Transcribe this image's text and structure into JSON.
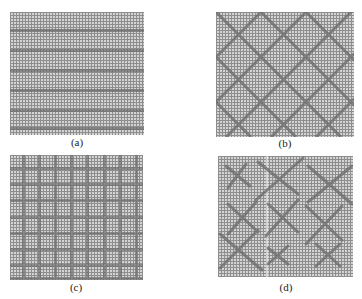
{
  "figure": {
    "panels": [
      {
        "id": "a",
        "label": "(a)",
        "description": "mesh grid with horizontal dark stripes",
        "bounds": {
          "x": 10,
          "y": 12,
          "w": 134,
          "h": 123
        },
        "stripes_horizontal_y": [
          18,
          38,
          58,
          78,
          98,
          116
        ]
      },
      {
        "id": "b",
        "label": "(b)",
        "description": "mesh grid with diagonal diamond lattice",
        "bounds": {
          "x": 216,
          "y": 12,
          "w": 138,
          "h": 125
        },
        "diagonal_spacing": 45
      },
      {
        "id": "c",
        "label": "(c)",
        "description": "mesh grid with orthogonal square lattice",
        "bounds": {
          "x": 10,
          "y": 155,
          "w": 133,
          "h": 125
        },
        "lines_vertical_x": [
          13,
          29,
          45,
          61,
          77,
          94,
          110,
          126
        ],
        "lines_horizontal_y": [
          13,
          29,
          45,
          62,
          78,
          94,
          110,
          123
        ]
      },
      {
        "id": "d",
        "label": "(d)",
        "description": "mesh grid with scattered X-shaped crosses",
        "bounds": {
          "x": 218,
          "y": 156,
          "w": 135,
          "h": 121
        },
        "crosses": [
          {
            "cx": 20,
            "cy": 20,
            "r": 12
          },
          {
            "cx": 60,
            "cy": 22,
            "r": 20
          },
          {
            "cx": 112,
            "cy": 28,
            "r": 20
          },
          {
            "cx": 25,
            "cy": 62,
            "r": 16
          },
          {
            "cx": 65,
            "cy": 62,
            "r": 16
          },
          {
            "cx": 105,
            "cy": 68,
            "r": 18
          },
          {
            "cx": 20,
            "cy": 95,
            "r": 20
          },
          {
            "cx": 60,
            "cy": 100,
            "r": 10
          },
          {
            "cx": 110,
            "cy": 100,
            "r": 13
          }
        ]
      }
    ],
    "colors": {
      "mesh_bg": "#cfcfcf",
      "mesh_line": "#8e8e8e",
      "feature": "#6f6f6f",
      "label": "#222222"
    }
  }
}
